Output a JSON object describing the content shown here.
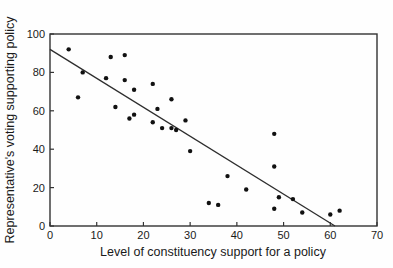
{
  "chart_data": {
    "type": "scatter",
    "title": "",
    "xlabel": "Level of constituency support for a policy",
    "ylabel": "Representative's voting supporting policy",
    "xlim": [
      0,
      70
    ],
    "ylim": [
      0,
      100
    ],
    "xticks": [
      0,
      10,
      20,
      30,
      40,
      50,
      60,
      70
    ],
    "yticks": [
      0,
      20,
      40,
      60,
      80,
      100
    ],
    "grid": false,
    "legend": false,
    "points": [
      [
        4,
        92
      ],
      [
        6,
        67
      ],
      [
        7,
        80
      ],
      [
        12,
        77
      ],
      [
        13,
        88
      ],
      [
        14,
        62
      ],
      [
        16,
        89
      ],
      [
        16,
        76
      ],
      [
        17,
        56
      ],
      [
        18,
        71
      ],
      [
        18,
        58
      ],
      [
        22,
        74
      ],
      [
        22,
        54
      ],
      [
        23,
        61
      ],
      [
        24,
        51
      ],
      [
        26,
        66
      ],
      [
        26,
        51
      ],
      [
        27,
        50
      ],
      [
        29,
        55
      ],
      [
        30,
        39
      ],
      [
        34,
        12
      ],
      [
        36,
        11
      ],
      [
        38,
        26
      ],
      [
        42,
        19
      ],
      [
        48,
        48
      ],
      [
        48,
        31
      ],
      [
        48,
        9
      ],
      [
        49,
        15
      ],
      [
        52,
        14
      ],
      [
        54,
        7
      ],
      [
        60,
        6
      ],
      [
        62,
        8
      ]
    ],
    "trendline": {
      "x1": 0,
      "y1": 92,
      "x2": 61,
      "y2": 0
    },
    "colors": {
      "point": "#111111",
      "line": "#2e2e2e",
      "frame": "#333333",
      "text": "#1a1a1a",
      "background": "#fefefe"
    }
  }
}
